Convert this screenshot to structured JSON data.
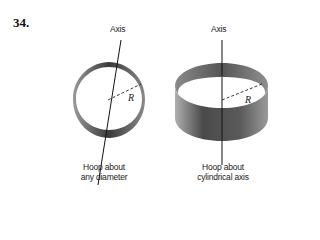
{
  "problem_number": "34.",
  "figures": [
    {
      "id": "hoop-diameter",
      "axis_label": "Axis",
      "radius_label": "R",
      "caption": [
        "Hoop about",
        "any diameter"
      ]
    },
    {
      "id": "hoop-cylindrical",
      "axis_label": "Axis",
      "radius_label": "R",
      "caption": [
        "Hoop about",
        "cylindrical axis"
      ]
    }
  ],
  "colors": {
    "band_dark": "#3a3a3a",
    "band_mid": "#7a7a7a",
    "band_light": "#b5b5b5",
    "line": "#111111"
  }
}
